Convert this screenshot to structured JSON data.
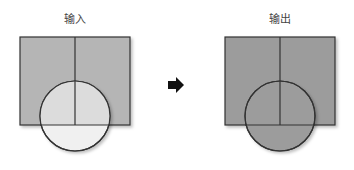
{
  "diagram": {
    "input": {
      "label": "输入",
      "rect_fill": "#b5b5b5",
      "circle_fill_inside": "#dcdcdc",
      "circle_fill_outside": "#f0f0f0"
    },
    "output": {
      "label": "输出",
      "rect_fill": "#9c9c9c",
      "circle_fill": "#9c9c9c"
    },
    "arrow": {
      "icon": "arrow-right-icon",
      "color": "#111111"
    },
    "stroke_color": "#333333"
  }
}
